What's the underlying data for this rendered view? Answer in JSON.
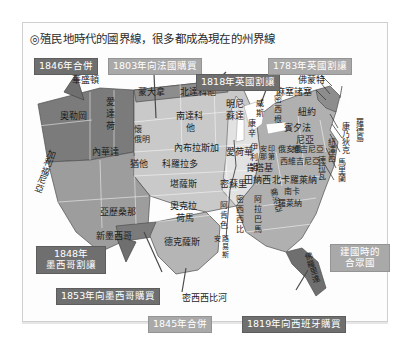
{
  "figure": {
    "title": "◎殖民地時代的國界線，很多都成為現在的州界線"
  },
  "annotations": [
    {
      "id": "a1846",
      "label": "1846年合併",
      "tone": "dark"
    },
    {
      "id": "a1803",
      "label": "1803年向法國購買",
      "tone": "light"
    },
    {
      "id": "a1818",
      "label": "1818年英國割讓",
      "tone": "dark"
    },
    {
      "id": "a1783",
      "label": "1783年英國割讓",
      "tone": "light"
    },
    {
      "id": "a1848",
      "label": "1848年\n墨西哥割讓",
      "tone": "dark"
    },
    {
      "id": "a1853",
      "label": "1853年向墨西哥購買",
      "tone": "dark"
    },
    {
      "id": "a1845",
      "label": "1845年合併",
      "tone": "light"
    },
    {
      "id": "a1819",
      "label": "1819年向西班牙購買",
      "tone": "dark"
    },
    {
      "id": "afound",
      "label": "建國時的\n合眾國",
      "tone": "light"
    }
  ],
  "annotation_text": {
    "a1846": "1846年合併",
    "a1803": "1803年向法國購買",
    "a1818": "1818年英國割讓",
    "a1783": "1783年英國割讓",
    "a1848_l1": "1848年",
    "a1848_l2": "墨西哥割讓",
    "a1853": "1853年向墨西哥購買",
    "a1845": "1845年合併",
    "a1819": "1819年向西班牙購買",
    "afound_l1": "建國時的",
    "afound_l2": "合眾國"
  },
  "states": {
    "washington": "華盛頓",
    "oregon": "奧勒岡",
    "idaho_l1": "愛",
    "idaho_l2": "達",
    "idaho_l3": "荷",
    "montana": "蒙大拿",
    "north_dakota": "北達科他",
    "minnesota_l1": "明尼",
    "minnesota_l2": "蘇達",
    "wisconsin_l1": "威",
    "wisconsin_l2": "斯",
    "wisconsin_l3": "康",
    "wisconsin_l4": "辛",
    "michigan_l1": "密",
    "michigan_l2": "西",
    "michigan_l3": "根",
    "wyoming_l1": "懷",
    "wyoming_l2": "俄明",
    "south_dakota_l1": "南達科",
    "south_dakota_l2": "他",
    "nevada": "內華達",
    "utah": "猶他",
    "colorado": "科羅拉多",
    "nebraska": "內布拉斯加",
    "iowa": "愛荷華",
    "illinois_l1": "伊",
    "illinois_l2": "利",
    "illinois_l3": "諾",
    "indiana_l1": "印",
    "indiana_l2": "第",
    "indiana_l3": "安",
    "indiana_l4": "那",
    "ohio": "俄亥俄",
    "california": "加利福尼亞",
    "arizona": "亞歷桑那",
    "new_mexico": "新墨西哥",
    "kansas": "堪薩斯",
    "missouri": "密蘇里",
    "oklahoma_l1": "奧克拉",
    "oklahoma_l2": "荷馬",
    "arkansas_l1": "阿",
    "arkansas_l2": "肯",
    "arkansas_l3": "色",
    "texas": "德克薩斯",
    "louisiana_l1": "路",
    "louisiana_l2": "易",
    "louisiana_l3": "斯",
    "louisiana_l4": "安",
    "mississippi_l1": "密",
    "mississippi_l2": "西",
    "mississippi_l3": "西",
    "mississippi_l4": "比",
    "alabama_l1": "阿",
    "alabama_l2": "拉",
    "alabama_l3": "巴",
    "alabama_l4": "馬",
    "tennessee": "田納西",
    "kentucky": "肯塔基",
    "west_virginia": "西維吉尼亞",
    "virginia": "維吉尼亞",
    "north_carolina": "北卡羅萊納",
    "south_carolina_l1": "南卡",
    "south_carolina_l2": "羅萊納",
    "georgia": "喬治亞",
    "florida": "佛羅里達",
    "pennsylvania_l1": "賓夕法",
    "pennsylvania_l2": "尼亞",
    "new_york": "紐約",
    "maine": "緬因",
    "new_hampshire": "新罕布夏",
    "vermont": "佛蒙特",
    "massachusetts": "麻塞諸塞",
    "rhode_island": "羅德島",
    "connecticut": "康乃狄克",
    "new_jersey": "紐澤西",
    "delaware": "德拉瓦",
    "maryland": "馬里蘭"
  },
  "river_label": {
    "mississippi_river": "密西西比河"
  },
  "colors": {
    "tag_dark": "#6f6f6f",
    "tag_light": "#a9a9a9",
    "region_dark": "#6b6b6b",
    "region_mid": "#9a9a9a",
    "region_light": "#c9c9c9",
    "region_pale": "#e0e0e0",
    "panel_border": "#cfcfcf",
    "title_text": "#2b2b2b"
  }
}
